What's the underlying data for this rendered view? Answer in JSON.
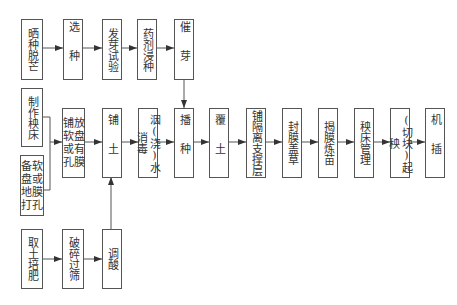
{
  "diagram": {
    "type": "flowchart",
    "title": "",
    "nodes": {
      "n_shaizhong": {
        "label": "晒种脱芒"
      },
      "n_xuanzhong": {
        "label": "选种"
      },
      "n_fayashiyan": {
        "label": "发芽试验"
      },
      "n_yaojijinzhong": {
        "label": "药剂浸种"
      },
      "n_cuiya": {
        "label": "催芽"
      },
      "n_zhizuoyangchuang": {
        "label": "制作秧床"
      },
      "n_beiruanpan": {
        "label": "备软盘或地膜打孔"
      },
      "n_pufangruanpan": {
        "label": "铺放软盘或有孔膜"
      },
      "n_putu": {
        "label": "铺土"
      },
      "n_yinjiaoshui": {
        "label": "洇(浇)水消毒"
      },
      "n_bozhong": {
        "label": "播种"
      },
      "n_futu": {
        "label": "覆土"
      },
      "n_pugeli": {
        "label": "铺隔离支撑层"
      },
      "n_fengmo": {
        "label": "封膜盖草"
      },
      "n_jiemo": {
        "label": "揭膜炼苗"
      },
      "n_yangchuang": {
        "label": "秧床管理"
      },
      "n_qiyang": {
        "label": "(切块)起秧"
      },
      "n_jicha": {
        "label": "机插"
      },
      "n_qutu": {
        "label": "取土培肥"
      },
      "n_posui": {
        "label": "破碎过筛"
      },
      "n_tiaosuan": {
        "label": "调酸"
      }
    },
    "edges": [
      [
        "晒种脱芒",
        "选种"
      ],
      [
        "选种",
        "发芽试验"
      ],
      [
        "发芽试验",
        "药剂浸种"
      ],
      [
        "药剂浸种",
        "催芽"
      ],
      [
        "催芽",
        "播种"
      ],
      [
        "制作秧床",
        "铺放软盘或有孔膜"
      ],
      [
        "备软盘或地膜打孔",
        "铺放软盘或有孔膜"
      ],
      [
        "铺放软盘或有孔膜",
        "铺土"
      ],
      [
        "铺土",
        "洇(浇)水消毒"
      ],
      [
        "洇(浇)水消毒",
        "播种"
      ],
      [
        "播种",
        "覆土"
      ],
      [
        "覆土",
        "铺隔离支撑层"
      ],
      [
        "铺隔离支撑层",
        "封膜盖草"
      ],
      [
        "封膜盖草",
        "揭膜炼苗"
      ],
      [
        "揭膜炼苗",
        "秧床管理"
      ],
      [
        "秧床管理",
        "(切块)起秧"
      ],
      [
        "(切块)起秧",
        "机插"
      ],
      [
        "取土培肥",
        "破碎过筛"
      ],
      [
        "破碎过筛",
        "调酸"
      ],
      [
        "调酸",
        "铺土"
      ]
    ],
    "colors": {
      "line": "#555555",
      "text": "#333333",
      "background": "#ffffff"
    }
  }
}
